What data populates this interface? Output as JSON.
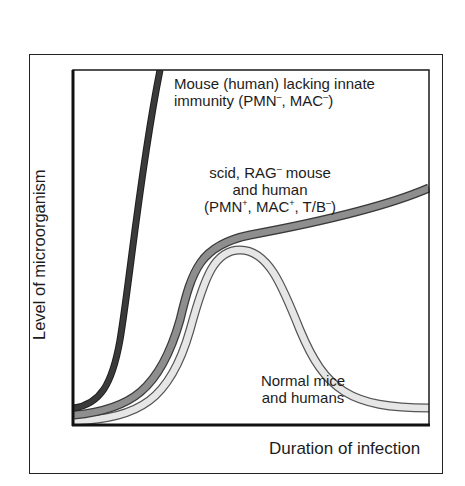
{
  "figure": {
    "x_axis_label": "Duration of infection",
    "y_axis_label": "Level of microorganism"
  },
  "curves": [
    {
      "id": "no-innate",
      "label_lines": [
        {
          "text": "Mouse (human) lacking innate"
        },
        {
          "parts": [
            {
              "t": "immunity (PMN"
            },
            {
              "sup": "–"
            },
            {
              "t": ", MAC"
            },
            {
              "sup": "–"
            },
            {
              "t": ")"
            }
          ]
        }
      ],
      "fill_color": "#3a3a3a",
      "outline_color": "#1e1e1e",
      "path": "M 74 408 C 100 404, 112 385, 120 340 C 130 280, 140 170, 160 70"
    },
    {
      "id": "scid-rag",
      "label_lines": [
        {
          "parts": [
            {
              "t": "scid, RAG"
            },
            {
              "sup": "–"
            },
            {
              "t": " mouse"
            }
          ]
        },
        {
          "text": "and human"
        },
        {
          "parts": [
            {
              "t": "(PMN"
            },
            {
              "sup": "+"
            },
            {
              "t": ", MAC"
            },
            {
              "sup": "+"
            },
            {
              "t": ", T/B"
            },
            {
              "sup": "–"
            },
            {
              "t": ")"
            }
          ]
        }
      ],
      "fill_color": "#8e8e8e",
      "outline_color": "#3a3a3a",
      "path": "M 74 415 C 130 410, 160 390, 180 320 C 192 270, 200 245, 250 235 C 320 222, 390 205, 429 188"
    },
    {
      "id": "normal",
      "label_lines": [
        {
          "text": "Normal mice"
        },
        {
          "text": "and humans"
        }
      ],
      "fill_color": "#e6e6e6",
      "outline_color": "#555555",
      "path": "M 74 421 C 140 418, 170 400, 190 330 C 205 275, 215 250, 240 250 C 268 250, 282 285, 300 330 C 325 390, 350 408, 429 408"
    }
  ],
  "chart_data": {
    "type": "line",
    "title": "",
    "xlabel": "Duration of infection",
    "ylabel": "Level of microorganism",
    "axis_ticks": "none",
    "x": [
      0,
      0.1,
      0.2,
      0.3,
      0.4,
      0.5,
      0.6,
      0.7,
      0.8,
      0.9,
      1.0
    ],
    "series": [
      {
        "name": "Mouse (human) lacking innate immunity (PMN-, MAC-)",
        "values": [
          0.05,
          0.25,
          0.75,
          1.0,
          null,
          null,
          null,
          null,
          null,
          null,
          null
        ]
      },
      {
        "name": "scid, RAG- mouse and human (PMN+, MAC+, T/B-)",
        "values": [
          0.03,
          0.06,
          0.15,
          0.35,
          0.5,
          0.53,
          0.56,
          0.59,
          0.62,
          0.66,
          0.7
        ]
      },
      {
        "name": "Normal mice and humans",
        "values": [
          0.01,
          0.03,
          0.1,
          0.3,
          0.49,
          0.45,
          0.3,
          0.12,
          0.06,
          0.05,
          0.05
        ]
      }
    ],
    "ylim": [
      0,
      1
    ],
    "xlim": [
      0,
      1
    ],
    "legend": "inline annotations",
    "grid": false
  }
}
